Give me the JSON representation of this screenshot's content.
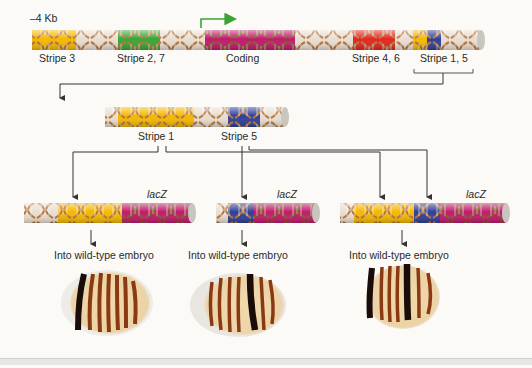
{
  "figure": {
    "scale_label": "–4 Kb",
    "colors": {
      "stripe3": "#f5b800",
      "stripe27": "#3aa535",
      "coding": "#c01a6a",
      "stripe46": "#e3261d",
      "stripe1": "#f5b800",
      "stripe5": "#2f3f99",
      "backbone": "#e9ddd0",
      "helix": "#b4743a",
      "arrow_green": "#3aa535",
      "line": "#333333",
      "background": "#fbfaf6"
    },
    "top_construct": {
      "labels": {
        "stripe3": "Stripe 3",
        "stripe27": "Stripe 2, 7",
        "coding": "Coding",
        "stripe46": "Stripe 4, 6",
        "stripe15": "Stripe 1, 5"
      }
    },
    "middle_construct": {
      "labels": {
        "stripe1": "Stripe 1",
        "stripe5": "Stripe 5"
      }
    },
    "reporters": [
      {
        "reporter_label": "lacZ",
        "caption": "Into wild-type embryo",
        "enhancers": [
          "Stripe 1"
        ]
      },
      {
        "reporter_label": "lacZ",
        "caption": "Into wild-type embryo",
        "enhancers": [
          "Stripe 5"
        ]
      },
      {
        "reporter_label": "lacZ",
        "caption": "Into wild-type embryo",
        "enhancers": [
          "Stripe 1",
          "Stripe 5"
        ]
      }
    ]
  }
}
